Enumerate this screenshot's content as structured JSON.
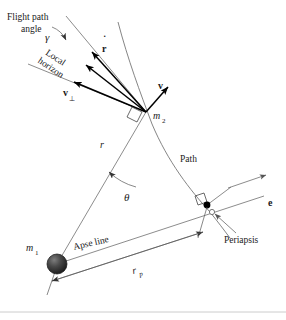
{
  "figure": {
    "background_color": "#ffffff",
    "line_color": "#6e6e6e",
    "vector_color": "#000000",
    "body_color": "#3a3a3a"
  },
  "labels": {
    "flight_path_angle_line1": "Flight path",
    "flight_path_angle_line2": "angle",
    "gamma": "γ",
    "local_horizon_line1": "Local",
    "local_horizon_line2": "horizon",
    "r_dot": "r",
    "r_dot_accent": "˙",
    "v_perp": "v",
    "v_perp_sub": "⊥",
    "v_radial": "v",
    "v_radial_sub": "r",
    "m2": "m",
    "m2_sub": "2",
    "m1": "m",
    "m1_sub": "1",
    "r": "r",
    "theta": "θ",
    "path": "Path",
    "e_vector": "e",
    "periapsis": "Periapsis",
    "apse_line": "Apse line",
    "r_p": "r",
    "r_p_sub": "p"
  },
  "geometry": {
    "m1_point": [
      57,
      264
    ],
    "m2_point": [
      146,
      112
    ],
    "periapsis_point": [
      207,
      205
    ],
    "e_arrow_tip": [
      264,
      195
    ],
    "r_label_point": [
      105,
      146
    ],
    "theta_label_point": [
      130,
      196
    ],
    "apse_line_angle_deg": -13,
    "local_horizon_angle_deg": 36,
    "body_radius_px": 10,
    "rp_dimension_label": "r_p"
  }
}
